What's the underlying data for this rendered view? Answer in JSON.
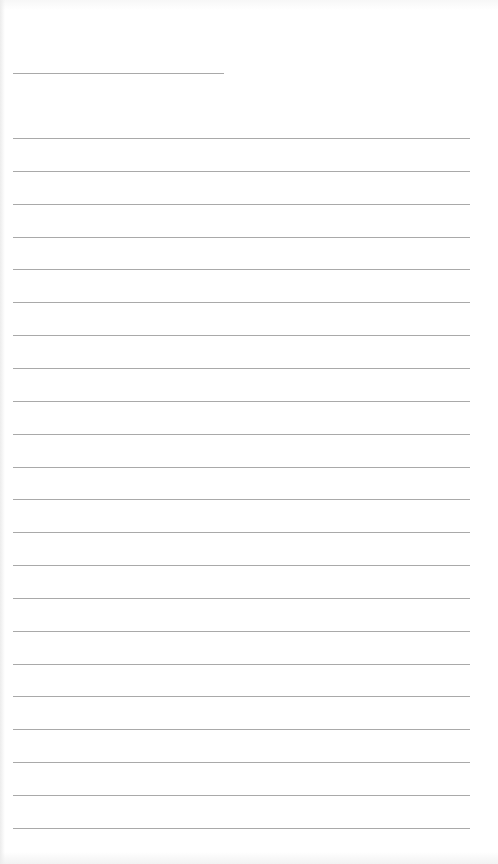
{
  "page": {
    "type": "blank lined paper",
    "header_line": {
      "x": 13,
      "y": 73,
      "width": 211
    },
    "ruled_lines": {
      "count": 22,
      "start_y": 138,
      "spacing": 32.85,
      "x": 13,
      "width": 457
    },
    "colors": {
      "paper": "#ffffff",
      "line": "#a9a9a9"
    }
  }
}
